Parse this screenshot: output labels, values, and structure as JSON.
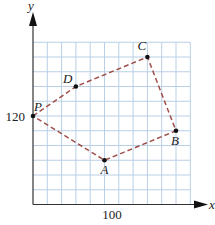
{
  "diagram": {
    "type": "coordinate-grid-polygon",
    "axes": {
      "x_label": "x",
      "y_label": "y",
      "x_tick_label": "100",
      "x_tick_value": 100,
      "y_tick_label": "120",
      "y_tick_value": 120,
      "units_per_cell": 20
    },
    "grid": {
      "columns": 11,
      "rows": 11,
      "line_color": "#b9cfe6",
      "axis_color": "#333333"
    },
    "path_color": "#a0504a",
    "points": [
      {
        "name": "P",
        "x": 0,
        "y": 120
      },
      {
        "name": "D",
        "x": 60,
        "y": 160
      },
      {
        "name": "C",
        "x": 160,
        "y": 200
      },
      {
        "name": "B",
        "x": 200,
        "y": 100
      },
      {
        "name": "A",
        "x": 100,
        "y": 60
      }
    ],
    "path_order": [
      "P",
      "D",
      "C",
      "B",
      "A",
      "P"
    ]
  }
}
